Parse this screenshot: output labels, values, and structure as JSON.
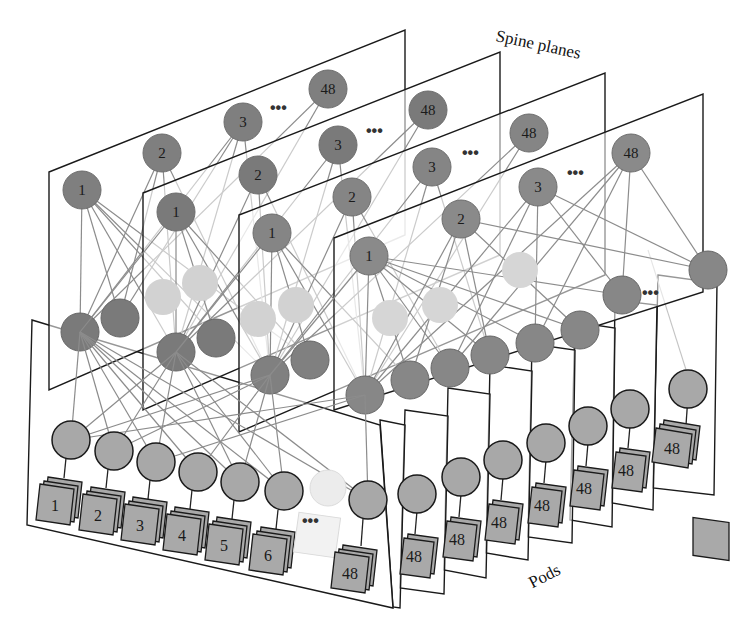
{
  "labels": {
    "spine_planes": "Spine planes",
    "pods": "Pods"
  },
  "colors": {
    "spine_node": "#7f7f7f",
    "leaf_node": "#8a8a8a",
    "tor_node": "#a8a8a8",
    "server": "#a9a9a9",
    "faint_node": "#d0d0d0",
    "link": "#8c8c8c",
    "plane_border": "#1a1a1a"
  },
  "spine_planes": {
    "count_shown": 4,
    "nodes_per_plane": [
      "1",
      "2",
      "3",
      "...",
      "48"
    ]
  },
  "pods": {
    "count_shown": 9,
    "tors_front_pod": [
      "1",
      "2",
      "3",
      "4",
      "5",
      "6",
      "...",
      "48"
    ],
    "tor_label_back_pods": "48",
    "ellipsis": "..."
  },
  "ellipsis": "•••"
}
